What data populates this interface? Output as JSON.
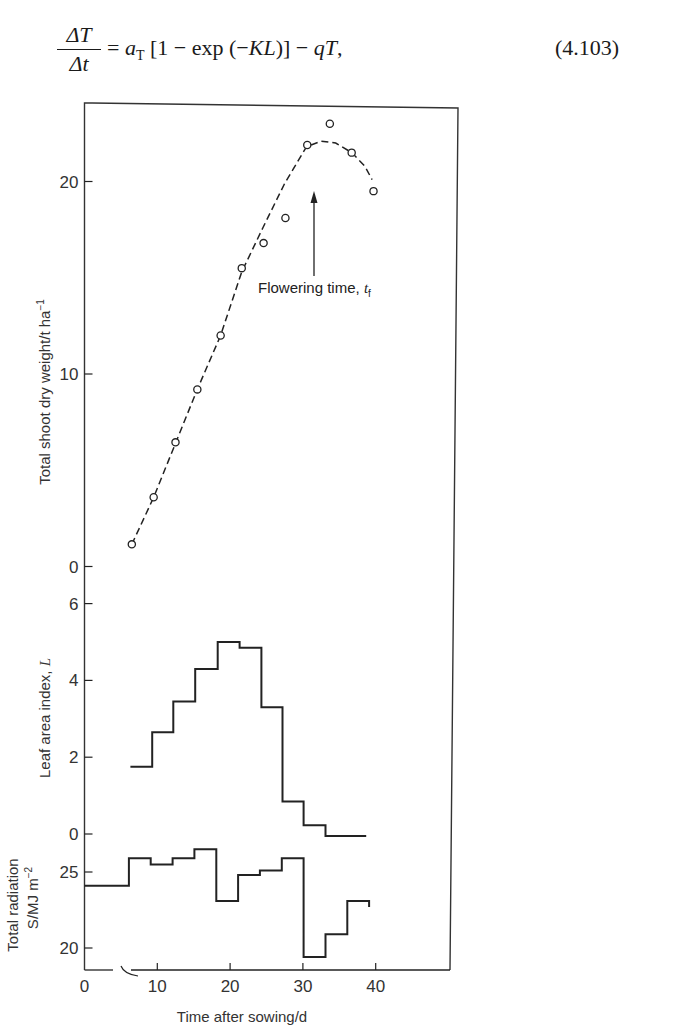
{
  "equation": {
    "numerator": "ΔT",
    "denominator": "Δt",
    "rhs": "= aₜ [1 − exp (−KL)] − qT,",
    "rhs_parts": {
      "a": "a",
      "sub": "T",
      "rest": " [1 − exp (−",
      "KL": "KL",
      "close": ")] − ",
      "qT": "qT",
      "comma": ","
    },
    "number": "(4.103)"
  },
  "chart_data": [
    {
      "type": "scatter",
      "title": "",
      "ylabel": "Total shoot dry weight/t ha⁻¹",
      "xlabel": "Time after sowing/d",
      "ylim": [
        0,
        23
      ],
      "yticks": [
        0,
        10,
        20
      ],
      "x": [
        6.5,
        9.5,
        12.5,
        15.5,
        18.7,
        21.6,
        24.6,
        27.6,
        30.6,
        33.7,
        36.7,
        39.7
      ],
      "values": [
        1.15,
        3.6,
        6.45,
        9.2,
        12.0,
        15.5,
        16.8,
        18.1,
        21.9,
        23.0,
        21.5,
        19.5
      ],
      "fitted_curve": {
        "style": "dashed",
        "x": [
          6.5,
          9.5,
          12.5,
          15.5,
          18.7,
          21.6,
          24.5,
          27.5,
          30.5,
          32.5,
          34.5,
          36.7,
          38.5,
          39.5
        ],
        "y": [
          1.15,
          3.6,
          6.4,
          9.2,
          12.0,
          15.3,
          17.6,
          19.9,
          21.8,
          22.1,
          22.0,
          21.5,
          20.8,
          20.1
        ]
      },
      "annotation": {
        "text": "Flowering time, ",
        "symbol": "t",
        "sub": "f",
        "x": 31.5
      }
    },
    {
      "type": "step",
      "ylabel": "Leaf area index, L",
      "ylim": [
        0,
        6
      ],
      "yticks": [
        0,
        2,
        4,
        6
      ],
      "edges": [
        6.3,
        9.3,
        12.2,
        15.2,
        18.3,
        21.3,
        24.3,
        27.2,
        30.1,
        33.1,
        38.7
      ],
      "values": [
        1.75,
        2.65,
        3.45,
        4.3,
        5.0,
        4.85,
        3.3,
        0.85,
        0.23,
        -0.05
      ]
    },
    {
      "type": "step",
      "ylabel": "Total radiation S/MJ m⁻²",
      "ylim": [
        20,
        25
      ],
      "yticks": [
        20,
        25
      ],
      "edges": [
        0,
        6.1,
        9.1,
        12.1,
        15.1,
        18.1,
        21.1,
        24.1,
        27.1,
        30.1,
        33.1,
        36.1,
        39.1
      ],
      "values": [
        24.1,
        25.9,
        25.5,
        25.9,
        26.5,
        23.1,
        24.8,
        25.1,
        25.9,
        19.4,
        20.9,
        23.1
      ],
      "end_drop": 22.7
    }
  ],
  "axes": {
    "x_ticks": [
      0,
      10,
      20,
      30,
      40
    ],
    "x_tick_labels": [
      "0",
      "10",
      "20",
      "30",
      "40"
    ],
    "xlabel": "Time after sowing/d",
    "weight_ylabel": "Total shoot dry weight/t ha",
    "weight_ylabel_sup": "−1",
    "weight_tick_labels": [
      "0",
      "10",
      "20"
    ],
    "lai_ylabel": "Leaf area index, ",
    "lai_symbol": "L",
    "lai_tick_labels": [
      "0",
      "2",
      "4",
      "6"
    ],
    "rad_ylabel_line1": "Total radiation",
    "rad_ylabel_line2": "S/MJ m",
    "rad_ylabel_sup": "−2",
    "rad_tick_labels": [
      "20",
      "25"
    ]
  },
  "colors": {
    "ink": "#222222",
    "frame": "#333333",
    "text": "#333333"
  }
}
